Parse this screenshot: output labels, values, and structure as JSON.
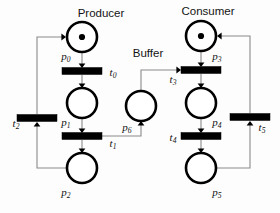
{
  "diagram": {
    "type": "petri-net",
    "title_visible": false,
    "colors": {
      "background": "#fdfdfd",
      "stroke": "#000000",
      "arc": "#8a8a8a",
      "token": "#000000",
      "transition_fill": "#000000",
      "place_fill": "#ffffff",
      "label_text": "#141414"
    },
    "group_labels": [
      {
        "id": "producer",
        "text": "Producer",
        "x": 101,
        "y": 17
      },
      {
        "id": "buffer",
        "text": "Buffer",
        "x": 148,
        "y": 57
      },
      {
        "id": "consumer",
        "text": "Consumer",
        "x": 208,
        "y": 15
      }
    ],
    "places": [
      {
        "id": "p0",
        "label": "p",
        "sub": "0",
        "cx": 82,
        "cy": 37,
        "r": 15,
        "tokens": 1,
        "label_x": 66,
        "label_y": 60
      },
      {
        "id": "p1",
        "label": "p",
        "sub": "1",
        "cx": 82,
        "cy": 103,
        "r": 15,
        "tokens": 0,
        "label_x": 66,
        "label_y": 126
      },
      {
        "id": "p2",
        "label": "p",
        "sub": "2",
        "cx": 82,
        "cy": 168,
        "r": 15,
        "tokens": 0,
        "label_x": 66,
        "label_y": 196
      },
      {
        "id": "p3",
        "label": "p",
        "sub": "3",
        "cx": 201,
        "cy": 36,
        "r": 15,
        "tokens": 1,
        "label_x": 217,
        "label_y": 60
      },
      {
        "id": "p4",
        "label": "p",
        "sub": "4",
        "cx": 201,
        "cy": 103,
        "r": 15,
        "tokens": 0,
        "label_x": 217,
        "label_y": 126
      },
      {
        "id": "p5",
        "label": "p",
        "sub": "5",
        "cx": 201,
        "cy": 168,
        "r": 15,
        "tokens": 0,
        "label_x": 217,
        "label_y": 196
      },
      {
        "id": "p6",
        "label": "p",
        "sub": "6",
        "cx": 141,
        "cy": 106,
        "r": 15,
        "tokens": 0,
        "label_x": 127,
        "label_y": 131
      }
    ],
    "transitions": [
      {
        "id": "t0",
        "label": "t",
        "sub": "0",
        "cx": 82,
        "cy": 71,
        "w": 40,
        "h": 7,
        "label_x": 113,
        "label_y": 76
      },
      {
        "id": "t1",
        "label": "t",
        "sub": "1",
        "cx": 82,
        "cy": 136,
        "w": 40,
        "h": 7,
        "label_x": 113,
        "label_y": 147
      },
      {
        "id": "t2",
        "label": "t",
        "sub": "2",
        "cx": 37,
        "cy": 118,
        "w": 40,
        "h": 7,
        "label_x": 16,
        "label_y": 127
      },
      {
        "id": "t3",
        "label": "t",
        "sub": "3",
        "cx": 201,
        "cy": 70,
        "w": 40,
        "h": 7,
        "label_x": 173,
        "label_y": 83
      },
      {
        "id": "t4",
        "label": "t",
        "sub": "4",
        "cx": 201,
        "cy": 136,
        "w": 40,
        "h": 7,
        "label_x": 173,
        "label_y": 141
      },
      {
        "id": "t5",
        "label": "t",
        "sub": "5",
        "cx": 250,
        "cy": 117,
        "w": 40,
        "h": 7,
        "label_x": 262,
        "label_y": 131
      }
    ],
    "arcs": [
      {
        "id": "arc-p0-t0",
        "from": "p0",
        "to": "t0",
        "path": "M 82 52 L 82 67",
        "head": {
          "x": 82,
          "y": 68,
          "dir": "down"
        }
      },
      {
        "id": "arc-t0-p1",
        "from": "t0",
        "to": "p1",
        "path": "M 82 75 L 82 87",
        "head": {
          "x": 82,
          "y": 88,
          "dir": "down"
        }
      },
      {
        "id": "arc-p1-t1",
        "from": "p1",
        "to": "t1",
        "path": "M 82 118 L 82 132",
        "head": {
          "x": 82,
          "y": 133,
          "dir": "down"
        }
      },
      {
        "id": "arc-t1-p2",
        "from": "t1",
        "to": "p2",
        "path": "M 82 140 L 82 152",
        "head": {
          "x": 82,
          "y": 153,
          "dir": "down"
        }
      },
      {
        "id": "arc-p2-t2",
        "from": "p2",
        "to": "t2",
        "path": "M 67 168 L 37 168 L 37 124",
        "head": {
          "x": 37,
          "y": 122,
          "dir": "up"
        }
      },
      {
        "id": "arc-t2-p0",
        "from": "t2",
        "to": "p0",
        "path": "M 37 114 L 37 37 L 64 37",
        "head": {
          "x": 66,
          "y": 37,
          "dir": "right"
        }
      },
      {
        "id": "arc-t1-p6",
        "from": "t1",
        "to": "p6",
        "path": "M 102 136 L 141 136 L 141 123",
        "head": {
          "x": 141,
          "y": 121,
          "dir": "up"
        }
      },
      {
        "id": "arc-p6-t3",
        "from": "p6",
        "to": "t3",
        "path": "M 141 91 L 141 70 L 179 70",
        "head": {
          "x": 181,
          "y": 70,
          "dir": "right"
        }
      },
      {
        "id": "arc-p3-t3",
        "from": "p3",
        "to": "t3",
        "path": "M 201 51 L 201 66",
        "head": {
          "x": 201,
          "y": 67,
          "dir": "down"
        }
      },
      {
        "id": "arc-t3-p4",
        "from": "t3",
        "to": "p4",
        "path": "M 201 74 L 201 87",
        "head": {
          "x": 201,
          "y": 88,
          "dir": "down"
        }
      },
      {
        "id": "arc-p4-t4",
        "from": "p4",
        "to": "t4",
        "path": "M 201 118 L 201 132",
        "head": {
          "x": 201,
          "y": 133,
          "dir": "down"
        }
      },
      {
        "id": "arc-t4-p5",
        "from": "t4",
        "to": "p5",
        "path": "M 201 140 L 201 152",
        "head": {
          "x": 201,
          "y": 153,
          "dir": "down"
        }
      },
      {
        "id": "arc-p5-t5",
        "from": "p5",
        "to": "t5",
        "path": "M 216 168 L 250 168 L 250 123",
        "head": {
          "x": 250,
          "y": 121,
          "dir": "up"
        }
      },
      {
        "id": "arc-t5-p3",
        "from": "t5",
        "to": "p3",
        "path": "M 250 113 L 250 36 L 219 36",
        "head": {
          "x": 217,
          "y": 36,
          "dir": "left"
        }
      }
    ]
  }
}
